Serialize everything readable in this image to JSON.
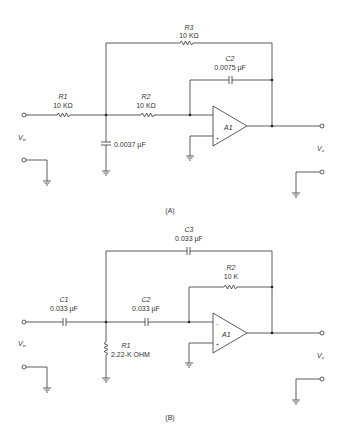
{
  "figure": {
    "circuit_a": {
      "caption": "(A)",
      "r1": {
        "name": "R1",
        "value": "10 KΩ"
      },
      "r2": {
        "name": "R2",
        "value": "10 KΩ"
      },
      "r3": {
        "name": "R3",
        "value": "10 KΩ"
      },
      "c1": {
        "value": "0.0037 µF"
      },
      "c2": {
        "name": "C2",
        "value": "0.0075 µF"
      },
      "opamp": "A1",
      "vin": "V",
      "vin_sub": "in",
      "vout": "V",
      "vout_sub": "o",
      "minus": "−",
      "plus": "+"
    },
    "circuit_b": {
      "caption": "(B)",
      "c1": {
        "name": "C1",
        "value": "0.033 µF"
      },
      "c2": {
        "name": "C2",
        "value": "0.033 µF"
      },
      "c3": {
        "name": "C3",
        "value": "0.033 µF"
      },
      "r1": {
        "name": "R1",
        "value": "2.22-K OHM"
      },
      "r2": {
        "name": "R2",
        "value": "10 K"
      },
      "opamp": "A1",
      "vin": "V",
      "vin_sub": "in",
      "vout": "V",
      "vout_sub": "o",
      "minus": "−",
      "plus": "+"
    }
  }
}
